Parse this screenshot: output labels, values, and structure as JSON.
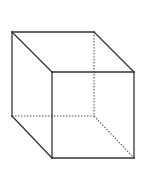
{
  "diagram": {
    "type": "wireframe-cube",
    "colors": {
      "background": "#ffffff",
      "solid_edge": "#333333",
      "hidden_edge": "#555555"
    },
    "vertices": {
      "back_top_left": [
        12,
        32
      ],
      "back_top_right": [
        94,
        32
      ],
      "back_bottom_right": [
        94,
        116
      ],
      "back_bottom_left": [
        12,
        116
      ],
      "front_top_left": [
        52,
        72
      ],
      "front_top_right": [
        134,
        72
      ],
      "front_bottom_right": [
        134,
        158
      ],
      "front_bottom_left": [
        52,
        158
      ]
    },
    "solid_edges": [
      [
        "back_top_left",
        "back_top_right"
      ],
      [
        "back_top_left",
        "back_bottom_left"
      ],
      [
        "back_top_left",
        "front_top_left"
      ],
      [
        "back_top_right",
        "front_top_right"
      ],
      [
        "back_bottom_left",
        "front_bottom_left"
      ],
      [
        "front_top_left",
        "front_top_right"
      ],
      [
        "front_top_right",
        "front_bottom_right"
      ],
      [
        "front_bottom_right",
        "front_bottom_left"
      ],
      [
        "front_bottom_left",
        "front_top_left"
      ]
    ],
    "hidden_edges": [
      [
        "back_top_right",
        "back_bottom_right"
      ],
      [
        "back_bottom_left",
        "back_bottom_right"
      ],
      [
        "back_bottom_right",
        "front_bottom_right"
      ]
    ]
  }
}
